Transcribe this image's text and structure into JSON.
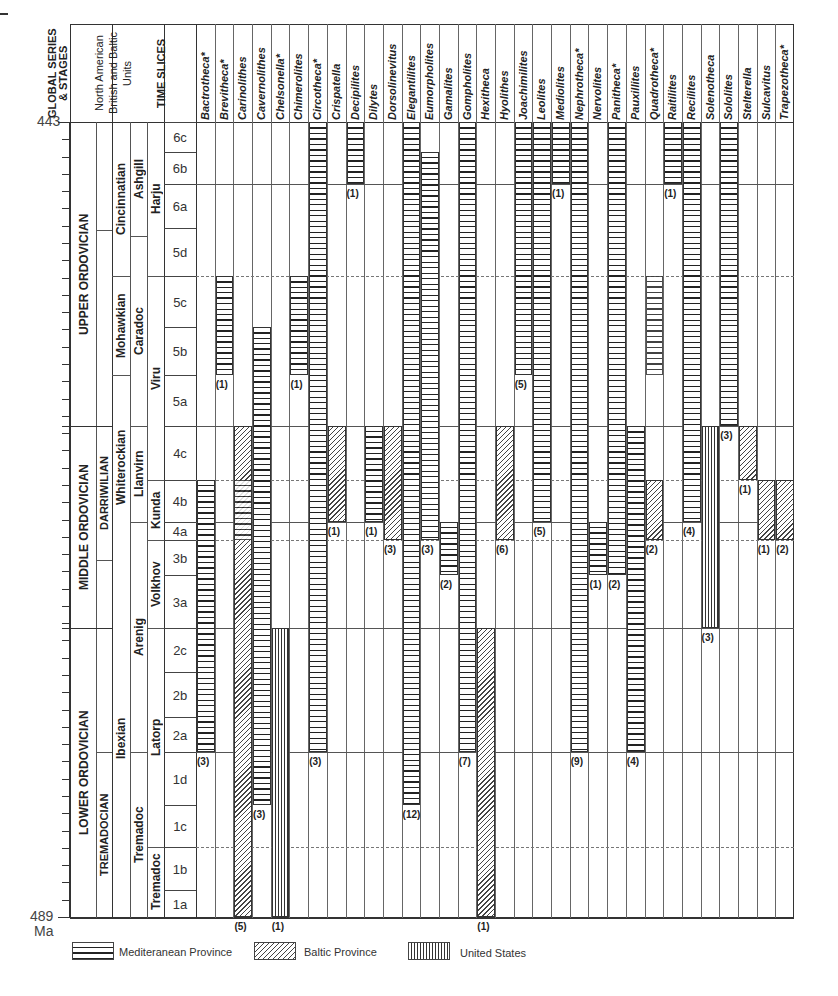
{
  "chart_data": {
    "type": "range-chart",
    "y_axis": {
      "top_label": "443",
      "bottom_label": "489",
      "unit_label": "Ma",
      "top": 443,
      "bottom": 489
    },
    "header_columns": [
      "GLOBAL SERIES & STAGES",
      "North American British and Baltic Units",
      "TIME SLICES"
    ],
    "global_series": [
      {
        "name": "UPPER ORDOVICIAN",
        "from": "5a",
        "to": "6c"
      },
      {
        "name": "MIDDLE ORDOVICIAN",
        "from": "3a",
        "to": "4c"
      },
      {
        "name": "LOWER ORDOVICIAN",
        "from": "1a",
        "to": "2c"
      }
    ],
    "global_stages": [
      {
        "name": "DARRIWILIAN",
        "from": "3b",
        "to": "4c"
      },
      {
        "name": "TREMADOCIAN",
        "from": "1a",
        "to": "1d"
      }
    ],
    "north_american_units": [
      "Cincinnatian",
      "Mohawkian",
      "Whiterockian",
      "Ibexian"
    ],
    "british_units": [
      "Ashgill",
      "Caradoc",
      "Llanvirn",
      "Arenig",
      "Tremadoc"
    ],
    "baltic_units": [
      "Harju",
      "Viru",
      "Kunda",
      "Volkhov",
      "Latorp",
      "Tremadoc"
    ],
    "time_slices": [
      "6c",
      "6b",
      "6a",
      "5d",
      "5c",
      "5b",
      "5a",
      "4c",
      "4b",
      "4a",
      "3b",
      "3a",
      "2c",
      "2b",
      "2a",
      "1d",
      "1c",
      "1b",
      "1a"
    ],
    "legend": [
      {
        "key": "med",
        "label": "Mediteranean Province",
        "pattern": "horizontal lines"
      },
      {
        "key": "bal",
        "label": "Baltic Province",
        "pattern": "diagonal hatch"
      },
      {
        "key": "us",
        "label": "United States",
        "pattern": "vertical lines"
      }
    ],
    "genera": [
      {
        "name": "Bactrotheca*",
        "ranges": [
          {
            "p": "med",
            "from": "2a",
            "to": "4b"
          }
        ],
        "count": "(3)"
      },
      {
        "name": "Brevitheca*",
        "ranges": [
          {
            "p": "med",
            "from": "5b",
            "to": "5c"
          }
        ],
        "count": "(1)"
      },
      {
        "name": "Carinolithes",
        "ranges": [
          {
            "p": "bal",
            "from": "1a",
            "to": "4c"
          },
          {
            "p": "med",
            "from": "4a",
            "to": "4b"
          }
        ],
        "count": "(5)"
      },
      {
        "name": "Cavernolithes",
        "ranges": [
          {
            "p": "med",
            "from": "1d",
            "to": "5b"
          }
        ],
        "count": "(3)"
      },
      {
        "name": "Chelsonella*",
        "ranges": [
          {
            "p": "us",
            "from": "1a",
            "to": "2c"
          }
        ],
        "count": "(1)"
      },
      {
        "name": "Chimerolites",
        "ranges": [
          {
            "p": "med",
            "from": "5b",
            "to": "5c"
          }
        ],
        "count": "(1)"
      },
      {
        "name": "Circotheca*",
        "ranges": [
          {
            "p": "med",
            "from": "2a",
            "to": "6c"
          }
        ],
        "count": "(3)"
      },
      {
        "name": "Crispatella",
        "ranges": [
          {
            "p": "bal",
            "from": "4b",
            "to": "4c"
          }
        ],
        "count": "(1)"
      },
      {
        "name": "Decipilites",
        "ranges": [
          {
            "p": "med",
            "from": "6b",
            "to": "6c"
          }
        ],
        "count": "(1)"
      },
      {
        "name": "Dilytes",
        "ranges": [
          {
            "p": "med",
            "from": "4b",
            "to": "4c"
          }
        ],
        "count": "(1)"
      },
      {
        "name": "Dorsolinevitus",
        "ranges": [
          {
            "p": "bal",
            "from": "4a",
            "to": "4c"
          }
        ],
        "count": "(3)"
      },
      {
        "name": "Elegantilites",
        "ranges": [
          {
            "p": "med",
            "from": "1d",
            "to": "6c"
          }
        ],
        "count": "(12)"
      },
      {
        "name": "Eumorpholites",
        "ranges": [
          {
            "p": "med",
            "from": "4a",
            "to": "6b"
          }
        ],
        "count": "(3)"
      },
      {
        "name": "Gamalites",
        "ranges": [
          {
            "p": "med",
            "from": "3b",
            "to": "4a"
          }
        ],
        "count": "(2)"
      },
      {
        "name": "Gompholites",
        "ranges": [
          {
            "p": "med",
            "from": "2a",
            "to": "6c"
          }
        ],
        "count": "(7)"
      },
      {
        "name": "Hexitheca",
        "ranges": [
          {
            "p": "bal",
            "from": "1a",
            "to": "2c"
          }
        ],
        "count": "(1)"
      },
      {
        "name": "Hyolithes",
        "ranges": [
          {
            "p": "bal",
            "from": "4a",
            "to": "4c"
          }
        ],
        "count": "(6)"
      },
      {
        "name": "Joachimilites",
        "ranges": [
          {
            "p": "med",
            "from": "5b",
            "to": "6c"
          }
        ],
        "count": "(5)"
      },
      {
        "name": "Leolites",
        "ranges": [
          {
            "p": "med",
            "from": "4b",
            "to": "6c"
          }
        ],
        "count": "(5)"
      },
      {
        "name": "Mediolites",
        "ranges": [
          {
            "p": "med",
            "from": "6b",
            "to": "6c"
          }
        ],
        "count": "(1)"
      },
      {
        "name": "Nephrotheca*",
        "ranges": [
          {
            "p": "med",
            "from": "2a",
            "to": "6c"
          }
        ],
        "count": "(9)"
      },
      {
        "name": "Nervolites",
        "ranges": [
          {
            "p": "med",
            "from": "3b",
            "to": "4a"
          }
        ],
        "count": "(1)"
      },
      {
        "name": "Panitheca*",
        "ranges": [
          {
            "p": "med",
            "from": "3b",
            "to": "6c"
          }
        ],
        "count": "(2)"
      },
      {
        "name": "Pauxillites",
        "ranges": [
          {
            "p": "med",
            "from": "2a",
            "to": "4c"
          }
        ],
        "count": "(4)"
      },
      {
        "name": "Quadrotheca*",
        "ranges": [
          {
            "p": "med",
            "from": "5b",
            "to": "5c"
          },
          {
            "p": "bal",
            "from": "4a",
            "to": "4b"
          }
        ],
        "count": "(2)"
      },
      {
        "name": "Raitilites",
        "ranges": [
          {
            "p": "med",
            "from": "6b",
            "to": "6c"
          }
        ],
        "count": "(1)"
      },
      {
        "name": "Recilites",
        "ranges": [
          {
            "p": "med",
            "from": "4b",
            "to": "6c"
          }
        ],
        "count": "(4)"
      },
      {
        "name": "Solenotheca",
        "ranges": [
          {
            "p": "us",
            "from": "3a",
            "to": "4c"
          }
        ],
        "count": "(3)"
      },
      {
        "name": "Sololites",
        "ranges": [
          {
            "p": "med",
            "from": "5a",
            "to": "6c"
          }
        ],
        "count": "(3)"
      },
      {
        "name": "Stelterella",
        "ranges": [
          {
            "p": "bal",
            "from": "4c",
            "to": "4c"
          }
        ],
        "count": "(1)"
      },
      {
        "name": "Sulcavitus",
        "ranges": [
          {
            "p": "bal",
            "from": "4a",
            "to": "4b"
          }
        ],
        "count": "(1)"
      },
      {
        "name": "Trapezotheca*",
        "ranges": [
          {
            "p": "bal",
            "from": "4a",
            "to": "4b"
          }
        ],
        "count": "(2)"
      }
    ]
  },
  "labels": {
    "ma_top": "443",
    "ma_bottom": "489",
    "ma_unit": "Ma",
    "hdr_global": "GLOBAL SERIES & STAGES",
    "hdr_units": "North American British and Baltic Units",
    "hdr_slices": "TIME SLICES",
    "upper": "UPPER ORDOVICIAN",
    "middle": "MIDDLE ORDOVICIAN",
    "lower": "LOWER ORDOVICIAN",
    "darriwilian": "DARRIWILIAN",
    "tremadocian": "TREMADOCIAN",
    "cincinnatian": "Cincinnatian",
    "mohawkian": "Mohawkian",
    "whiterockian": "Whiterockian",
    "ibexian": "Ibexian",
    "ashgill": "Ashgill",
    "caradoc": "Caradoc",
    "llanvirn": "Llanvirn",
    "arenig": "Arenig",
    "tremadoc_brit": "Tremadoc",
    "harju": "Harju",
    "viru": "Viru",
    "kunda": "Kunda",
    "volkhov": "Volkhov",
    "latorp": "Latorp",
    "tremadoc_balt": "Tremadoc",
    "legend_med": "Mediteranean Province",
    "legend_bal": "Baltic Province",
    "legend_us": "United States"
  }
}
